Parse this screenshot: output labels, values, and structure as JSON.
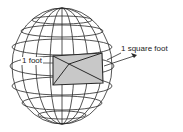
{
  "diagram": {
    "labels": {
      "side": "1 foot",
      "area": "1 square foot"
    },
    "colors": {
      "line": "#2a2a2a",
      "patch_fill": "#c8c8c8",
      "background": "#ffffff"
    }
  }
}
